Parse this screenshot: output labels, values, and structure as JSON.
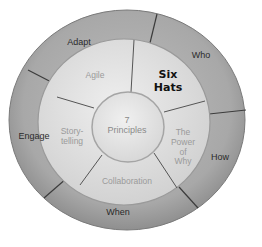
{
  "diagram": {
    "center": {
      "label_line1": "7",
      "label_line2": "Principles"
    },
    "middle_ring": [
      {
        "id": "agile",
        "label": "Agile"
      },
      {
        "id": "six-hats",
        "label_line1": "Six",
        "label_line2": "Hats",
        "emphasized": true
      },
      {
        "id": "power-of-why",
        "label_line1": "The",
        "label_line2": "Power",
        "label_line3": "of",
        "label_line4": "Why"
      },
      {
        "id": "collaboration",
        "label": "Collaboration"
      },
      {
        "id": "storytelling",
        "label_line1": "Story-",
        "label_line2": "telling"
      }
    ],
    "outer_ring": [
      {
        "id": "adapt",
        "label": "Adapt"
      },
      {
        "id": "who",
        "label": "Who"
      },
      {
        "id": "how",
        "label": "How"
      },
      {
        "id": "when",
        "label": "When"
      },
      {
        "id": "engage",
        "label": "Engage"
      }
    ],
    "colors": {
      "outer_ring": "#a9a9a9",
      "middle_ring": "#d9d9d9",
      "center": "#e4e4e4",
      "divider": "#3c3c3c",
      "emphasis_text": "#111111",
      "muted_text": "#9a9a9a"
    }
  }
}
